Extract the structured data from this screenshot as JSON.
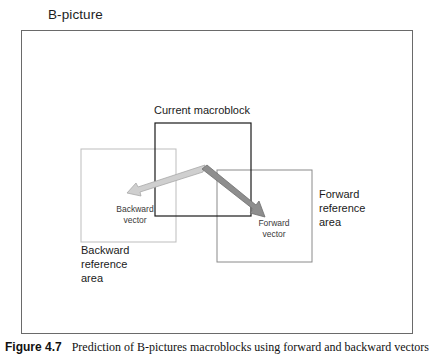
{
  "diagram": {
    "title": "B-picture",
    "current_block_label": "Current macroblock",
    "backward_vector_label": "Backward\nvector",
    "forward_vector_label": "Forward\nvector",
    "backward_area_label": "Backward\nreference\narea",
    "forward_area_label": "Forward\nreference\narea",
    "colors": {
      "frame": "#6a6a6a",
      "current_block": "#1a1a1a",
      "reference_box": "#b8b8b8",
      "forward_box": "#8a8a8a",
      "backward_arrow": "#c8c8c8",
      "forward_arrow": "#8c8c8c"
    },
    "shapes": {
      "frame": {
        "x": 21,
        "y": 30,
        "w": 392,
        "h": 304
      },
      "current_block": {
        "x": 155,
        "y": 123,
        "w": 96,
        "h": 93
      },
      "backward_area": {
        "x": 81,
        "y": 149,
        "w": 95,
        "h": 93
      },
      "forward_area": {
        "x": 217,
        "y": 170,
        "w": 95,
        "h": 92
      },
      "vector_origin": {
        "x": 204,
        "y": 168
      },
      "backward_tip": {
        "x": 127,
        "y": 193
      },
      "forward_tip": {
        "x": 265,
        "y": 217
      }
    }
  },
  "caption": {
    "figure_number": "Figure 4.7",
    "text": "Prediction of B-pictures macroblocks using forward and backward vectors"
  }
}
